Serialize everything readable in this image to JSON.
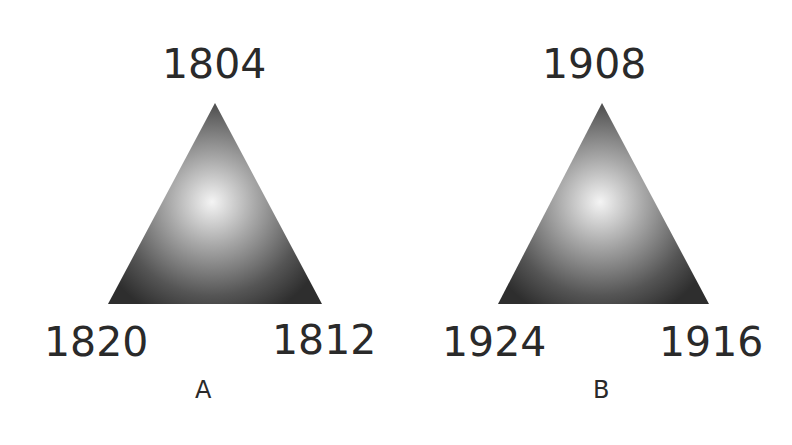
{
  "diagrams": [
    {
      "caption": "A",
      "top_label": "1804",
      "bottom_left_label": "1820",
      "bottom_right_label": "1812",
      "triangle": {
        "apex": [
          215,
          103
        ],
        "bottom_left": [
          108,
          304
        ],
        "bottom_right": [
          322,
          304
        ]
      }
    },
    {
      "caption": "B",
      "top_label": "1908",
      "bottom_left_label": "1924",
      "bottom_right_label": "1916",
      "triangle": {
        "apex": [
          602,
          103
        ],
        "bottom_left": [
          498,
          304
        ],
        "bottom_right": [
          709,
          304
        ]
      }
    }
  ],
  "colors": {
    "triangle_center": "#f2f2f2",
    "triangle_edge": "#2e2e2e",
    "text": "#2a2a2a",
    "background": "#ffffff"
  }
}
